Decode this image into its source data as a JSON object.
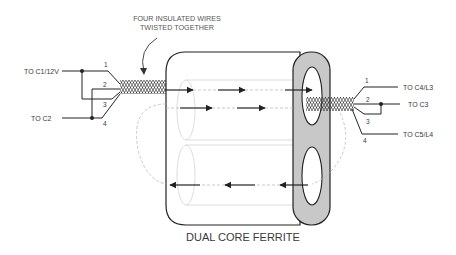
{
  "diagram": {
    "title": "DUAL CORE FERRITE",
    "annotation": [
      "FOUR INSULATED WIRES",
      "TWISTED TOGETHER"
    ],
    "left_terminals": [
      {
        "label": "TO C1/12V",
        "wires": [
          "1",
          "3"
        ]
      },
      {
        "label": "TO C2",
        "wires": [
          "2",
          "4"
        ]
      }
    ],
    "right_terminals": [
      {
        "label": "TO C4/L3",
        "wires": [
          "1"
        ]
      },
      {
        "label": "TO C3",
        "wires": [
          "2",
          "3"
        ]
      },
      {
        "label": "TO C5/L4",
        "wires": [
          "4"
        ]
      }
    ],
    "wire_numbers_left": [
      "1",
      "2",
      "3",
      "4"
    ],
    "wire_numbers_right": [
      "1",
      "2",
      "3",
      "4"
    ],
    "colors": {
      "line": "#222222",
      "ferrite_end": "#c8c8c8",
      "faint": "#bbbbbb",
      "text": "#3a3a3a"
    }
  }
}
